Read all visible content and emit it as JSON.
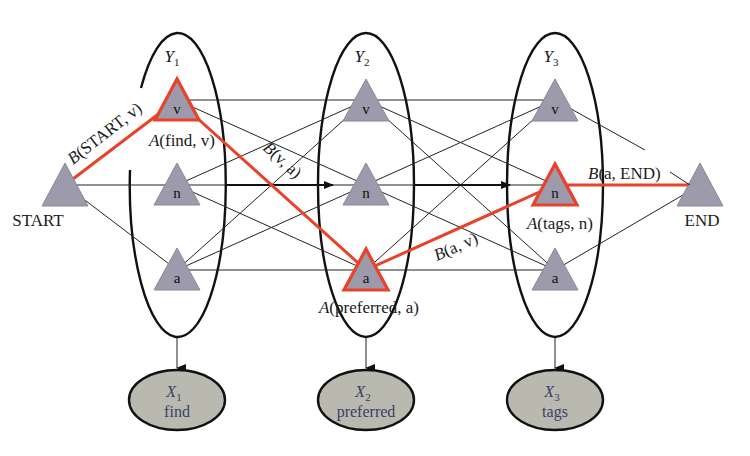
{
  "diagram": {
    "title": "",
    "colors": {
      "highlight": "#e8432a",
      "state_fill": "#9c9aab",
      "observation_fill": "#b9b9b0",
      "observation_text": "#3a3f6a",
      "line": "#222222"
    },
    "start_node": {
      "label": "START"
    },
    "end_node": {
      "label": "END"
    },
    "state_groups": [
      {
        "id": "Y1",
        "var": "Y",
        "sub": "1",
        "states": [
          "v",
          "n",
          "a"
        ]
      },
      {
        "id": "Y2",
        "var": "Y",
        "sub": "2",
        "states": [
          "v",
          "n",
          "a"
        ]
      },
      {
        "id": "Y3",
        "var": "Y",
        "sub": "3",
        "states": [
          "v",
          "n",
          "a"
        ]
      }
    ],
    "observations": [
      {
        "id": "X1",
        "var": "X",
        "sub": "1",
        "word": "find"
      },
      {
        "id": "X2",
        "var": "X",
        "sub": "2",
        "word": "preferred"
      },
      {
        "id": "X3",
        "var": "X",
        "sub": "3",
        "word": "tags"
      }
    ],
    "highlighted_path": [
      "START",
      "Y1.v",
      "Y2.a",
      "Y3.n",
      "END"
    ],
    "edge_labels": {
      "b_start_v": {
        "fn": "B",
        "args": "(START, v)"
      },
      "b_v_a": {
        "fn": "B",
        "args": "(v, a)"
      },
      "b_a_v": {
        "fn": "B",
        "args": "(a, v)"
      },
      "b_a_end": {
        "fn": "B",
        "args": "(a, END)"
      }
    },
    "emission_labels": {
      "a_find_v": {
        "fn": "A",
        "args": "(find, v)"
      },
      "a_preferred_a": {
        "fn": "A",
        "args": "(preferred, a)"
      },
      "a_tags_n": {
        "fn": "A",
        "args": "(tags, n)"
      }
    }
  }
}
